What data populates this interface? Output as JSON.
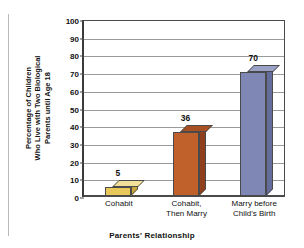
{
  "chart_data": {
    "type": "bar",
    "title": "",
    "xlabel": "Parents' Relationship",
    "ylabel": "Percentage of Children Who Live with Two Biological Parents until Age 18",
    "ylabel_lines": [
      "Percentage of Children",
      "Who Live with Two Biological",
      "Parents until Age 18"
    ],
    "categories": [
      "Cohabit",
      "Cohabit, Then Marry",
      "Marry before Child's Birth"
    ],
    "category_lines": [
      [
        "Cohabit"
      ],
      [
        "Cohabit,",
        "Then Marry"
      ],
      [
        "Marry before",
        "Child's Birth"
      ]
    ],
    "values": [
      5,
      36,
      70
    ],
    "value_labels": [
      "5",
      "36",
      "70"
    ],
    "ylim": [
      0,
      100
    ],
    "ytick_step": 10,
    "ytick_labels": [
      "0",
      "10",
      "20",
      "30",
      "40",
      "50",
      "60",
      "70",
      "80",
      "90",
      "100"
    ],
    "grid": true,
    "legend": false,
    "bar_colors": [
      "#e8c85a",
      "#c0602a",
      "#7f87b5"
    ],
    "bar_top_colors": [
      "#f2e09a",
      "#a85024",
      "#9aa2c8"
    ],
    "bar_side_colors": [
      "#c9a63c",
      "#8f3f1c",
      "#646c9c"
    ],
    "axis_color": "#4a4a4a",
    "gridline_color": "#9a9a9a",
    "background": "#ffffff"
  }
}
